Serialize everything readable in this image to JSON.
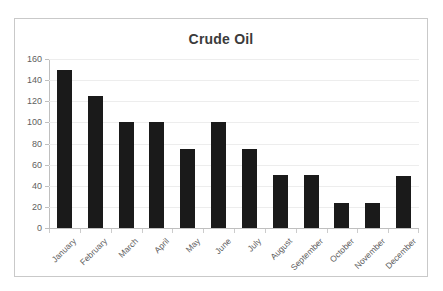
{
  "chart_data": {
    "type": "bar",
    "title": "Crude Oil",
    "xlabel": "",
    "ylabel": "",
    "categories": [
      "January",
      "February",
      "March",
      "April",
      "May",
      "June",
      "July",
      "August",
      "September",
      "October",
      "November",
      "December"
    ],
    "values": [
      150,
      125,
      100,
      100,
      75,
      100,
      75,
      50,
      50,
      24,
      24,
      49
    ],
    "series": [
      {
        "name": "Crude Oil",
        "values": [
          150,
          125,
          100,
          100,
          75,
          100,
          75,
          50,
          50,
          24,
          24,
          49
        ]
      }
    ],
    "ylim": [
      0,
      160
    ],
    "ytick_labels": [
      "160",
      "140",
      "120",
      "100",
      "80",
      "60",
      "40",
      "20",
      "0"
    ],
    "ytick_values": [
      160,
      140,
      120,
      100,
      80,
      60,
      40,
      20,
      0
    ],
    "ytick_step": 20,
    "grid": true,
    "grid_axis": "y",
    "legend": false,
    "legend_position": "none",
    "bar_color": "#1a1a1a",
    "grid_color": "#ededed",
    "axis_color": "#bfbfbf",
    "title_color": "#3b3b3b",
    "tick_label_color": "#606060",
    "xlabel_rotation": -45,
    "plot_background": "#ffffff",
    "frame_border_color": "#c9c9c9"
  }
}
